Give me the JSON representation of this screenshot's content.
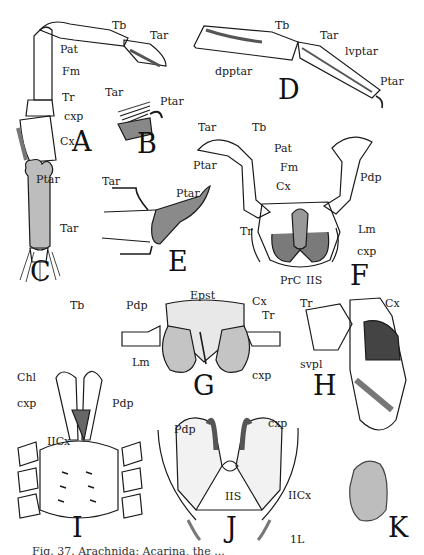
{
  "figure": {
    "caption": "Fig. 37. Arachnida: Acarina, the ...",
    "ink_color": "#1a1a1a",
    "background": "#ffffff"
  },
  "panels": {
    "A": {
      "letter": "A",
      "labels": [
        "Tb",
        "Tar",
        "Pat",
        "Fm",
        "Tr",
        "cxp",
        "Cx"
      ]
    },
    "B": {
      "letter": "B",
      "labels": [
        "Tar",
        "Ptar"
      ]
    },
    "C": {
      "letter": "C",
      "labels": [
        "Ptar",
        "Tar",
        "Tb"
      ]
    },
    "D": {
      "letter": "D",
      "labels": [
        "Tb",
        "Tar",
        "lvptar",
        "dpptar",
        "Ptar"
      ]
    },
    "E": {
      "letter": "E",
      "labels": [
        "Tar",
        "Ptar"
      ]
    },
    "F": {
      "letter": "F",
      "labels": [
        "Tar",
        "Tb",
        "Ptar",
        "Pat",
        "Fm",
        "Cx",
        "Pdp",
        "Tr",
        "Lm",
        "cxp",
        "PrC",
        "IIS"
      ]
    },
    "G": {
      "letter": "G",
      "labels": [
        "Epst",
        "Pdp",
        "Cx",
        "Tr",
        "Lm",
        "cxp"
      ]
    },
    "H": {
      "letter": "H",
      "labels": [
        "Tr",
        "Cx",
        "svpl"
      ]
    },
    "I": {
      "letter": "I",
      "labels": [
        "Chl",
        "cxp",
        "Pdp",
        "IICx"
      ]
    },
    "J": {
      "letter": "J",
      "labels": [
        "Pdp",
        "cxp",
        "IIS",
        "IICx",
        "1L"
      ]
    },
    "K": {
      "letter": "K",
      "labels": []
    }
  }
}
